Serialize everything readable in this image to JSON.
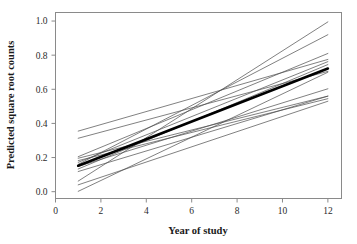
{
  "chart_data": {
    "type": "line",
    "title": "",
    "subtitle": "",
    "xlabel": "Year of study",
    "ylabel": "Predicted square root counts",
    "xlim": [
      0,
      12.6
    ],
    "ylim": [
      -0.04,
      1.05
    ],
    "xticks": [
      0,
      2,
      4,
      6,
      8,
      10,
      12
    ],
    "xtick_labels": [
      "0",
      "2",
      "4",
      "6",
      "8",
      "10",
      "12"
    ],
    "yticks": [
      0.0,
      0.2,
      0.4,
      0.6,
      0.8,
      1.0
    ],
    "ytick_labels": [
      "0.0",
      "0.2",
      "0.4",
      "0.6",
      "0.8",
      "1.0"
    ],
    "grid": false,
    "legend": "none",
    "x": [
      1,
      12
    ],
    "series": [
      {
        "name": "subject-1",
        "values": [
          0.355,
          0.775
        ],
        "emphasis": "thin"
      },
      {
        "name": "subject-2",
        "values": [
          0.313,
          0.705
        ],
        "emphasis": "thin"
      },
      {
        "name": "subject-3",
        "values": [
          0.205,
          0.81
        ],
        "emphasis": "thin"
      },
      {
        "name": "subject-4",
        "values": [
          0.196,
          0.56
        ],
        "emphasis": "thin"
      },
      {
        "name": "subject-5",
        "values": [
          0.182,
          0.545
        ],
        "emphasis": "thin"
      },
      {
        "name": "subject-6",
        "values": [
          0.172,
          0.762
        ],
        "emphasis": "thin"
      },
      {
        "name": "subject-7",
        "values": [
          0.16,
          0.92
        ],
        "emphasis": "thin"
      },
      {
        "name": "subject-8",
        "values": [
          0.148,
          0.603
        ],
        "emphasis": "thin"
      },
      {
        "name": "subject-9",
        "values": [
          0.133,
          0.745
        ],
        "emphasis": "thin"
      },
      {
        "name": "subject-10",
        "values": [
          0.118,
          0.56
        ],
        "emphasis": "thin"
      },
      {
        "name": "subject-11",
        "values": [
          0.062,
          0.995
        ],
        "emphasis": "thin"
      },
      {
        "name": "subject-12",
        "values": [
          0.04,
          0.53
        ],
        "emphasis": "thin"
      },
      {
        "name": "subject-13",
        "values": [
          0.002,
          0.7
        ],
        "emphasis": "thin"
      },
      {
        "name": "average",
        "values": [
          0.152,
          0.722
        ],
        "emphasis": "bold"
      }
    ]
  }
}
